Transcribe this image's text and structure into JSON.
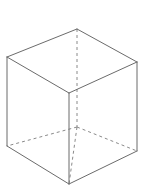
{
  "figure": {
    "shape_name": "cube",
    "projection": "isometric",
    "background_color": "#ffffff",
    "visible_edge_color": "#6b6b6b",
    "hidden_edge_color": "#8a8a8a",
    "edge_width_px": 1,
    "hidden_edge_dash": "3 3",
    "canvas": {
      "width": 151,
      "height": 191
    },
    "vertices": {
      "top_back": {
        "x": 77,
        "y": 29,
        "label": "top-back-vertex",
        "hidden": false
      },
      "top_left": {
        "x": 7,
        "y": 57,
        "label": "top-left-vertex",
        "hidden": false
      },
      "top_right": {
        "x": 137,
        "y": 62,
        "label": "top-right-vertex",
        "hidden": false
      },
      "top_front": {
        "x": 69,
        "y": 93,
        "label": "top-front-vertex",
        "hidden": false
      },
      "bottom_back": {
        "x": 77,
        "y": 127,
        "label": "bottom-back-vertex",
        "hidden": true
      },
      "bottom_left": {
        "x": 7,
        "y": 146,
        "label": "bottom-left-vertex",
        "hidden": false
      },
      "bottom_right": {
        "x": 137,
        "y": 151,
        "label": "bottom-right-vertex",
        "hidden": false
      },
      "bottom_front": {
        "x": 69,
        "y": 184,
        "label": "bottom-front-vertex",
        "hidden": false
      }
    },
    "edges": [
      {
        "name": "top-back-left-edge",
        "from": "top_back",
        "to": "top_left",
        "style": "solid"
      },
      {
        "name": "top-back-right-edge",
        "from": "top_back",
        "to": "top_right",
        "style": "solid"
      },
      {
        "name": "top-front-left-edge",
        "from": "top_left",
        "to": "top_front",
        "style": "solid"
      },
      {
        "name": "top-front-right-edge",
        "from": "top_front",
        "to": "top_right",
        "style": "solid"
      },
      {
        "name": "left-vertical-edge",
        "from": "top_left",
        "to": "bottom_left",
        "style": "solid"
      },
      {
        "name": "right-vertical-edge",
        "from": "top_right",
        "to": "bottom_right",
        "style": "solid"
      },
      {
        "name": "front-vertical-edge",
        "from": "top_front",
        "to": "bottom_front",
        "style": "solid"
      },
      {
        "name": "bottom-front-left-edge",
        "from": "bottom_left",
        "to": "bottom_front",
        "style": "solid"
      },
      {
        "name": "bottom-front-right-edge",
        "from": "bottom_front",
        "to": "bottom_right",
        "style": "solid"
      },
      {
        "name": "back-vertical-hidden-edge",
        "from": "top_back",
        "to": "bottom_back",
        "style": "hidden"
      },
      {
        "name": "bottom-back-left-hidden-edge",
        "from": "bottom_back",
        "to": "bottom_left",
        "style": "hidden"
      },
      {
        "name": "bottom-back-right-hidden-edge",
        "from": "bottom_back",
        "to": "bottom_right",
        "style": "hidden"
      },
      {
        "name": "bottom-back-front-hidden-edge",
        "from": "bottom_back",
        "to": "bottom_front",
        "style": "hidden"
      }
    ],
    "faces": [
      {
        "name": "top-face",
        "vertices": [
          "top_left",
          "top_back",
          "top_right",
          "top_front"
        ],
        "fill": "none"
      },
      {
        "name": "left-face",
        "vertices": [
          "top_left",
          "top_front",
          "bottom_front",
          "bottom_left"
        ],
        "fill": "none"
      },
      {
        "name": "right-face",
        "vertices": [
          "top_front",
          "top_right",
          "bottom_right",
          "bottom_front"
        ],
        "fill": "none"
      }
    ]
  }
}
